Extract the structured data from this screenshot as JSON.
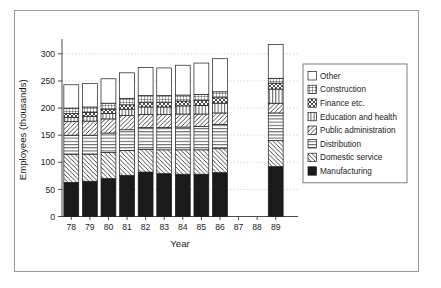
{
  "chart_data": {
    "type": "bar",
    "subtype": "stacked-bar",
    "title": "",
    "xlabel": "Year",
    "ylabel": "Employees (thousands)",
    "ylim": [
      0,
      320
    ],
    "yticks": [
      0,
      50,
      100,
      150,
      200,
      250,
      300
    ],
    "ytick_labels": [
      "0",
      "50",
      "100",
      "150",
      "200",
      "250",
      "300"
    ],
    "grid": true,
    "grid_axis": "y",
    "legend_position": "right",
    "categories": [
      "78",
      "79",
      "80",
      "81",
      "82",
      "83",
      "84",
      "85",
      "86",
      "87",
      "88",
      "89"
    ],
    "missing_categories": [
      "87",
      "88"
    ],
    "series": [
      {
        "name": "Manufacturing",
        "pattern": "solid-black",
        "values": [
          63,
          65,
          70,
          76,
          82,
          79,
          78,
          78,
          81,
          null,
          null,
          92
        ]
      },
      {
        "name": "Domestic service",
        "pattern": "diagonal-forward",
        "values": [
          52,
          50,
          48,
          46,
          42,
          44,
          45,
          45,
          44,
          null,
          null,
          48
        ]
      },
      {
        "name": "Distribution",
        "pattern": "horizontal-lines",
        "values": [
          35,
          35,
          36,
          38,
          40,
          41,
          42,
          43,
          45,
          null,
          null,
          51
        ]
      },
      {
        "name": "Public administration",
        "pattern": "diagonal-backward",
        "values": [
          25,
          26,
          26,
          26,
          24,
          24,
          24,
          23,
          21,
          null,
          null,
          18
        ]
      },
      {
        "name": "Education and health",
        "pattern": "vertical-lines",
        "values": [
          8,
          9,
          10,
          12,
          14,
          14,
          15,
          16,
          18,
          null,
          null,
          26
        ]
      },
      {
        "name": "Finance etc.",
        "pattern": "cross-diagonal",
        "values": [
          7,
          7,
          8,
          8,
          9,
          9,
          9,
          9,
          10,
          null,
          null,
          11
        ]
      },
      {
        "name": "Construction",
        "pattern": "fine-grid",
        "values": [
          10,
          10,
          11,
          12,
          12,
          12,
          11,
          11,
          11,
          null,
          null,
          9
        ]
      },
      {
        "name": "Other",
        "pattern": "empty-white",
        "values": [
          43,
          43,
          45,
          47,
          52,
          51,
          55,
          58,
          61,
          null,
          null,
          62
        ]
      }
    ],
    "totals": [
      243,
      245,
      254,
      265,
      275,
      274,
      279,
      283,
      291,
      null,
      null,
      317
    ],
    "legend_entries": [
      {
        "label": "Other",
        "pattern": "empty-white"
      },
      {
        "label": "Construction",
        "pattern": "fine-grid"
      },
      {
        "label": "Finance etc.",
        "pattern": "cross-diagonal"
      },
      {
        "label": "Education and health",
        "pattern": "vertical-lines"
      },
      {
        "label": "Public administration",
        "pattern": "diagonal-backward"
      },
      {
        "label": "Distribution",
        "pattern": "horizontal-lines"
      },
      {
        "label": "Domestic service",
        "pattern": "diagonal-forward"
      },
      {
        "label": "Manufacturing",
        "pattern": "solid-black"
      }
    ]
  },
  "colors": {
    "background": "#ffffff",
    "frame_border": "#9a9a9a",
    "axis": "#4a4a4a",
    "grid": "#b9b9b9",
    "text": "#1a1a1a",
    "fill": "#ffffff",
    "solid": "#1a1a1a"
  }
}
